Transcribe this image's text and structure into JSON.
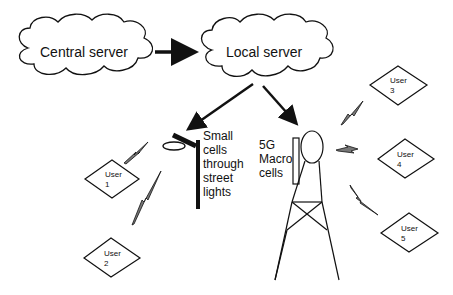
{
  "diagram": {
    "nodes": {
      "central_server": {
        "label": "Central server",
        "shape": "cloud"
      },
      "local_server": {
        "label": "Local server",
        "shape": "cloud"
      },
      "small_cells": {
        "label": "Small\ncells\nthrough\nstreet\nlights",
        "shape": "street-light"
      },
      "macro_cells": {
        "label": "5G\nMacro\ncells",
        "shape": "tower"
      },
      "users": [
        {
          "id": "user-1",
          "label": "User\n1"
        },
        {
          "id": "user-2",
          "label": "User\n2"
        },
        {
          "id": "user-3",
          "label": "User\n3"
        },
        {
          "id": "user-4",
          "label": "User\n4"
        },
        {
          "id": "user-5",
          "label": "User\n5"
        }
      ]
    },
    "edges": [
      {
        "from": "Central server",
        "to": "Local server",
        "type": "arrow"
      },
      {
        "from": "Local server",
        "to": "Small cells through street lights",
        "type": "arrow"
      },
      {
        "from": "Local server",
        "to": "5G Macro cells",
        "type": "arrow"
      },
      {
        "from": "Small cells through street lights",
        "to": "User 1",
        "type": "wireless"
      },
      {
        "from": "Small cells through street lights",
        "to": "User 2",
        "type": "wireless"
      },
      {
        "from": "5G Macro cells",
        "to": "User 3",
        "type": "wireless"
      },
      {
        "from": "5G Macro cells",
        "to": "User 4",
        "type": "wireless"
      },
      {
        "from": "5G Macro cells",
        "to": "User 5",
        "type": "wireless"
      }
    ],
    "colors": {
      "stroke": "#111111",
      "lightning_fill": "#777777",
      "background": "#ffffff"
    }
  }
}
